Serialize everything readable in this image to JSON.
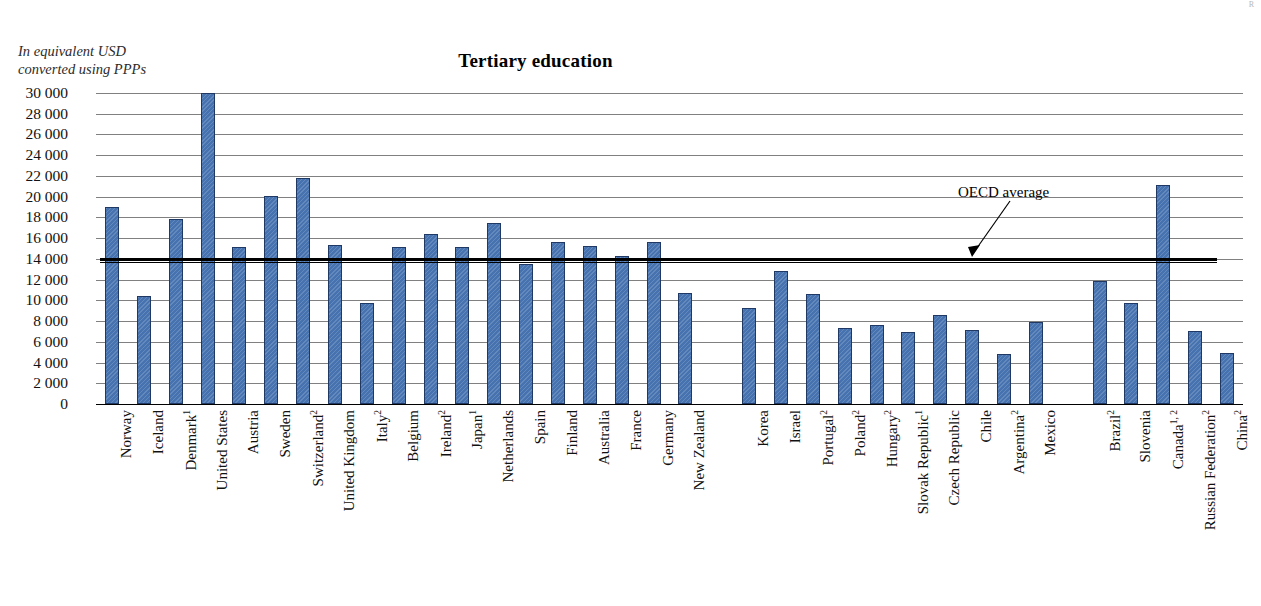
{
  "corner_mark": "R",
  "unit_note": "In equivalent USD\nconverted using PPPs",
  "annotation": {
    "oecd_average_label": "OECD average",
    "oecd_average_value": 14000
  },
  "colors": {
    "bar_fill": "#4673b0",
    "bar_border": "#1f3864",
    "gridline": "#808080",
    "average_line": "#000000"
  },
  "chart_data": {
    "type": "bar",
    "title": "Tertiary education",
    "xlabel": "",
    "ylabel": "In equivalent USD converted using PPPs",
    "ylim": [
      0,
      30000
    ],
    "ytick_step": 2000,
    "yticks": [
      "30 000",
      "28 000",
      "26 000",
      "24 000",
      "22 000",
      "20 000",
      "18 000",
      "16 000",
      "14 000",
      "12 000",
      "10 000",
      "8 000",
      "6 000",
      "4 000",
      "2 000",
      "0"
    ],
    "ytick_values": [
      30000,
      28000,
      26000,
      24000,
      22000,
      20000,
      18000,
      16000,
      14000,
      12000,
      10000,
      8000,
      6000,
      4000,
      2000,
      0
    ],
    "grid": true,
    "legend": "none",
    "average_line": 14000,
    "categories": [
      "Norway",
      "Iceland",
      "Denmark",
      "United States",
      "Austria",
      "Sweden",
      "Switzerland",
      "United Kingdom",
      "Italy",
      "Belgium",
      "Ireland",
      "Japan",
      "Netherlands",
      "Spain",
      "Finland",
      "Australia",
      "France",
      "Germany",
      "New Zealand",
      "Korea",
      "Israel",
      "Portugal",
      "Poland",
      "Hungary",
      "Slovak Republic",
      "Czech Republic",
      "Chile",
      "Argentina",
      "Mexico",
      "Brazil",
      "Slovenia",
      "Canada",
      "Russian Federation",
      "China"
    ],
    "category_labels": [
      {
        "name": "Norway",
        "note": ""
      },
      {
        "name": "Iceland",
        "note": ""
      },
      {
        "name": "Denmark",
        "note": "1"
      },
      {
        "name": "United States",
        "note": ""
      },
      {
        "name": "Austria",
        "note": ""
      },
      {
        "name": "Sweden",
        "note": ""
      },
      {
        "name": "Switzerland",
        "note": "2"
      },
      {
        "name": "United Kingdom",
        "note": ""
      },
      {
        "name": "Italy",
        "note": "2"
      },
      {
        "name": "Belgium",
        "note": ""
      },
      {
        "name": "Ireland",
        "note": "2"
      },
      {
        "name": "Japan",
        "note": "1"
      },
      {
        "name": "Netherlands",
        "note": ""
      },
      {
        "name": "Spain",
        "note": ""
      },
      {
        "name": "Finland",
        "note": ""
      },
      {
        "name": "Australia",
        "note": ""
      },
      {
        "name": "France",
        "note": ""
      },
      {
        "name": "Germany",
        "note": ""
      },
      {
        "name": "New Zealand",
        "note": ""
      },
      {
        "name": "Korea",
        "note": ""
      },
      {
        "name": "Israel",
        "note": ""
      },
      {
        "name": "Portugal",
        "note": "2"
      },
      {
        "name": "Poland",
        "note": "2"
      },
      {
        "name": "Hungary",
        "note": "2"
      },
      {
        "name": "Slovak Republic",
        "note": "1"
      },
      {
        "name": "Czech Republic",
        "note": ""
      },
      {
        "name": "Chile",
        "note": ""
      },
      {
        "name": "Argentina",
        "note": "2"
      },
      {
        "name": "Mexico",
        "note": ""
      },
      {
        "name": "Brazil",
        "note": "2"
      },
      {
        "name": "Slovenia",
        "note": ""
      },
      {
        "name": "Canada",
        "note": "1, 2"
      },
      {
        "name": "Russian Federation",
        "note": "2"
      },
      {
        "name": "China",
        "note": "2"
      }
    ],
    "values": [
      19000,
      10400,
      17800,
      30000,
      15100,
      20100,
      21800,
      15300,
      9700,
      15100,
      16400,
      15100,
      17500,
      13500,
      15600,
      15200,
      14300,
      15600,
      10700,
      9300,
      12800,
      10600,
      7300,
      7600,
      6900,
      8600,
      7100,
      4800,
      7900,
      11900,
      9700,
      21100,
      7000,
      4900
    ],
    "group_breaks_after": [
      "New Zealand",
      "Mexico"
    ]
  }
}
